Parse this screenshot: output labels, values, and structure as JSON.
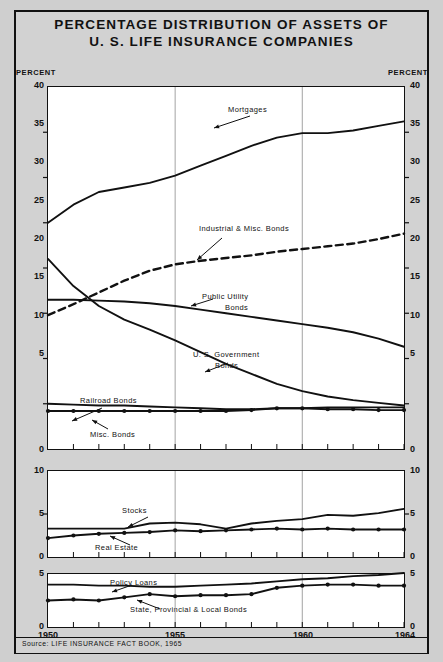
{
  "title": {
    "line1": "PERCENTAGE DISTRIBUTION OF ASSETS OF",
    "line2": "U. S. LIFE INSURANCE COMPANIES"
  },
  "axis_caption_left": "PERCENT",
  "axis_caption_right": "PERCENT",
  "source": "Source: LIFE INSURANCE FACT BOOK, 1965",
  "x_ticks": [
    "1950",
    "1955",
    "1960",
    "1964"
  ],
  "panel1": {
    "y_ticks": [
      "40",
      "35",
      "30",
      "25",
      "20",
      "15",
      "10",
      "5",
      "0"
    ]
  },
  "panel2": {
    "y_ticks": [
      "10",
      "5",
      "0"
    ]
  },
  "panel3": {
    "y_ticks": [
      "5",
      "0"
    ]
  },
  "labels": {
    "mortgages": "Mortgages",
    "industrial": "Industrial & Misc. Bonds",
    "public_utility_1": "Public Utility",
    "public_utility_2": "Bonds",
    "us_government_1": "U. S. Government",
    "us_government_2": "Bonds",
    "railroad": "Railroad Bonds",
    "misc_bonds": "Misc. Bonds",
    "stocks": "Stocks",
    "real_estate": "Real Estate",
    "policy_loans": "Policy Loans",
    "state_local": "State, Provincial & Local Bonds"
  },
  "chart_data": {
    "type": "line",
    "title": "PERCENTAGE DISTRIBUTION OF ASSETS OF U. S. LIFE INSURANCE COMPANIES",
    "xlabel": "",
    "ylabel": "PERCENT",
    "grid": "vertical-at-1955-1960",
    "legend": "inline-annotations-with-arrows",
    "source": "Source: LIFE INSURANCE FACT BOOK, 1965",
    "x": [
      1950,
      1951,
      1952,
      1953,
      1954,
      1955,
      1956,
      1957,
      1958,
      1959,
      1960,
      1961,
      1962,
      1963,
      1964
    ],
    "panels": [
      {
        "name": "panel1",
        "ylim": [
          0,
          40
        ],
        "yticks": [
          0,
          5,
          10,
          15,
          20,
          25,
          30,
          35,
          40
        ],
        "series": [
          {
            "name": "Mortgages",
            "style": "solid-thick",
            "values": [
              25.0,
              27.0,
              28.4,
              28.9,
              29.4,
              30.2,
              31.3,
              32.4,
              33.5,
              34.4,
              34.9,
              34.9,
              35.2,
              35.7,
              36.2
            ]
          },
          {
            "name": "Industrial & Misc. Bonds",
            "style": "dashed-thick",
            "values": [
              14.8,
              16.0,
              17.3,
              18.6,
              19.7,
              20.4,
              20.8,
              21.1,
              21.4,
              21.8,
              22.1,
              22.4,
              22.7,
              23.2,
              23.8
            ]
          },
          {
            "name": "Public Utility Bonds",
            "style": "solid-thick",
            "values": [
              16.5,
              16.5,
              16.4,
              16.3,
              16.1,
              15.8,
              15.4,
              15.0,
              14.6,
              14.2,
              13.8,
              13.4,
              12.9,
              12.2,
              11.3
            ]
          },
          {
            "name": "U. S. Government Bonds",
            "style": "solid-thick",
            "values": [
              21.0,
              18.0,
              15.8,
              14.3,
              13.2,
              12.0,
              10.7,
              9.4,
              8.3,
              7.2,
              6.4,
              5.8,
              5.4,
              5.1,
              4.8
            ]
          },
          {
            "name": "Railroad Bonds",
            "style": "solid-thick",
            "values": [
              5.0,
              4.9,
              4.8,
              4.8,
              4.7,
              4.6,
              4.5,
              4.4,
              4.4,
              4.5,
              4.5,
              4.6,
              4.6,
              4.6,
              4.6
            ]
          },
          {
            "name": "Misc. Bonds",
            "style": "solid-thick-dotted-markers",
            "values": [
              4.2,
              4.2,
              4.2,
              4.2,
              4.2,
              4.2,
              4.2,
              4.2,
              4.3,
              4.5,
              4.5,
              4.4,
              4.4,
              4.3,
              4.3
            ]
          }
        ]
      },
      {
        "name": "panel2",
        "ylim": [
          0,
          10
        ],
        "yticks": [
          0,
          5,
          10
        ],
        "series": [
          {
            "name": "Stocks",
            "style": "solid-thick",
            "values": [
              3.3,
              3.3,
              3.3,
              3.3,
              3.9,
              4.0,
              3.8,
              3.3,
              3.9,
              4.2,
              4.4,
              4.9,
              4.8,
              5.1,
              5.6
            ]
          },
          {
            "name": "Real Estate",
            "style": "solid-thick-dotted-markers",
            "values": [
              2.2,
              2.5,
              2.7,
              2.8,
              2.9,
              3.1,
              3.0,
              3.1,
              3.2,
              3.3,
              3.2,
              3.3,
              3.2,
              3.2,
              3.2
            ]
          }
        ]
      },
      {
        "name": "panel3",
        "ylim": [
          0,
          5
        ],
        "yticks": [
          0,
          5
        ],
        "series": [
          {
            "name": "Policy Loans",
            "style": "solid-thick",
            "values": [
              4.0,
              4.0,
              3.9,
              3.9,
              3.8,
              3.8,
              3.9,
              4.0,
              4.1,
              4.3,
              4.5,
              4.6,
              4.8,
              4.9,
              5.1
            ]
          },
          {
            "name": "State, Provincial & Local Bonds",
            "style": "solid-thick-dotted-markers",
            "values": [
              2.5,
              2.6,
              2.5,
              2.8,
              3.1,
              2.9,
              3.0,
              3.0,
              3.1,
              3.7,
              3.9,
              4.0,
              4.0,
              3.9,
              3.9
            ]
          }
        ]
      }
    ]
  }
}
